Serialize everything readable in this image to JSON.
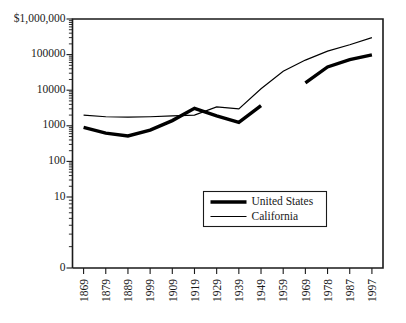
{
  "chart_data": {
    "type": "line",
    "title": "",
    "xlabel": "",
    "ylabel": "",
    "yscale": "log",
    "grid": false,
    "legend_position": "inside-center-right",
    "ylim": [
      100,
      1000000
    ],
    "categories": [
      "1869",
      "1879",
      "1889",
      "1999",
      "1909",
      "1919",
      "1929",
      "1939",
      "1949",
      "1959",
      "1969",
      "1978",
      "1987",
      "1997"
    ],
    "y_tick_labels": [
      "$1,000,000",
      "100000",
      "10000",
      "1000",
      "100",
      "10",
      "0"
    ],
    "y_tick_values": [
      1000000,
      100000,
      10000,
      1000,
      100,
      10,
      0
    ],
    "series": [
      {
        "name": "United States",
        "style": "thick",
        "color": "#000000",
        "values": [
          900,
          620,
          520,
          760,
          1400,
          3100,
          1900,
          1250,
          3700,
          null,
          16000,
          45000,
          72000,
          98000
        ]
      },
      {
        "name": "California",
        "style": "thin",
        "color": "#000000",
        "values": [
          2000,
          1800,
          1750,
          1800,
          1900,
          2000,
          3400,
          3000,
          11000,
          34000,
          70000,
          125000,
          190000,
          300000
        ]
      }
    ]
  },
  "legend": {
    "entries": [
      {
        "label": "United States",
        "style": "thick"
      },
      {
        "label": "California",
        "style": "thin"
      }
    ]
  },
  "axes": {
    "y_labels": [
      "$1,000,000",
      "100000",
      "10000",
      "1000",
      "100",
      "10",
      "0"
    ],
    "x_labels": [
      "1869",
      "1879",
      "1889",
      "1999",
      "1909",
      "1919",
      "1929",
      "1939",
      "1949",
      "1959",
      "1969",
      "1978",
      "1987",
      "1997"
    ]
  }
}
